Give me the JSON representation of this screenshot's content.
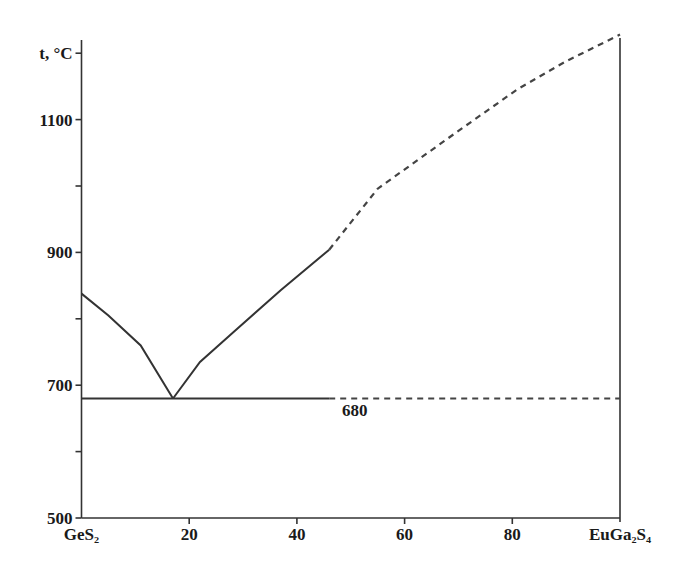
{
  "chart_data": {
    "type": "line",
    "title": "",
    "xlabel": "",
    "ylabel": "t, °C",
    "xlim": [
      0,
      100
    ],
    "ylim": [
      500,
      1200
    ],
    "grid": false,
    "legend": null,
    "x_ticks": [
      0,
      20,
      40,
      60,
      80,
      100
    ],
    "x_tick_labels": [
      "GeS₂",
      "20",
      "40",
      "60",
      "80",
      "EuGa₂S₄"
    ],
    "y_ticks": [
      500,
      600,
      700,
      800,
      900,
      1000,
      1100,
      1200
    ],
    "y_tick_labels": [
      "500",
      "",
      "700",
      "",
      "900",
      "",
      "1100",
      "t, °C"
    ],
    "series": [
      {
        "name": "liquidus-GeS2-side",
        "style": "solid",
        "x": [
          0,
          5,
          11,
          17
        ],
        "y": [
          838,
          805,
          760,
          680
        ]
      },
      {
        "name": "liquidus-EuGa2S4-side",
        "style": "solid",
        "x": [
          17,
          22,
          28.5,
          37,
          46
        ],
        "y": [
          680,
          735,
          782,
          843,
          904
        ]
      },
      {
        "name": "liquidus-EuGa2S4-side-extrapolated",
        "style": "dashed",
        "x": [
          46,
          55,
          70,
          81,
          90,
          100
        ],
        "y": [
          904,
          996,
          1083,
          1146,
          1188,
          1228
        ]
      },
      {
        "name": "eutectic",
        "style": "solid",
        "x": [
          0,
          46
        ],
        "y": [
          680,
          680
        ]
      },
      {
        "name": "eutectic-extrapolated",
        "style": "dashed",
        "x": [
          46,
          100
        ],
        "y": [
          680,
          680
        ]
      }
    ],
    "annotations": [
      {
        "text": "680",
        "x": 48,
        "y": 666
      }
    ],
    "eutectic_point": {
      "x": 17,
      "y": 680
    }
  },
  "labels": {
    "y_axis_title": "t, °C",
    "eutectic_temp": "680"
  }
}
